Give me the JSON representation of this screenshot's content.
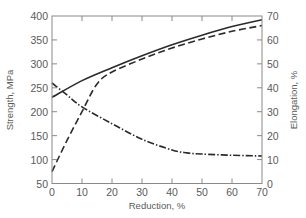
{
  "chart_data": {
    "type": "line",
    "title": "",
    "xlabel": "Reduction, %",
    "ylabel": "Strength, MPa",
    "y2label": "Elongation, %",
    "xlim": [
      0,
      70
    ],
    "ylim": [
      50,
      400
    ],
    "y2lim": [
      0,
      70
    ],
    "x_ticks": [
      0,
      10,
      20,
      30,
      40,
      50,
      60,
      70
    ],
    "y_ticks": [
      50,
      100,
      150,
      200,
      250,
      300,
      350,
      400
    ],
    "y2_ticks": [
      0,
      10,
      20,
      30,
      40,
      50,
      60,
      70
    ],
    "grid": false,
    "legend": "none",
    "series": [
      {
        "name": "Tensile strength",
        "axis": "left",
        "style": "solid",
        "x": [
          0,
          10,
          20,
          30,
          40,
          50,
          60,
          70
        ],
        "values": [
          230,
          265,
          292,
          317,
          340,
          360,
          378,
          392
        ]
      },
      {
        "name": "Yield strength",
        "axis": "left",
        "style": "dashed",
        "x": [
          0,
          5,
          10,
          15,
          20,
          30,
          40,
          50,
          60,
          70
        ],
        "values": [
          75,
          140,
          200,
          258,
          283,
          310,
          333,
          352,
          368,
          380
        ]
      },
      {
        "name": "Elongation",
        "axis": "right",
        "style": "dash-dot",
        "x": [
          0,
          5,
          10,
          20,
          30,
          40,
          45,
          50,
          60,
          70
        ],
        "values": [
          42,
          37,
          32,
          25,
          18.5,
          14,
          12.8,
          12.3,
          11.8,
          11.5
        ]
      }
    ]
  },
  "colors": {
    "axis": "#8a8a8a",
    "line": "#2b2b2b",
    "text": "#5a5a5a"
  }
}
